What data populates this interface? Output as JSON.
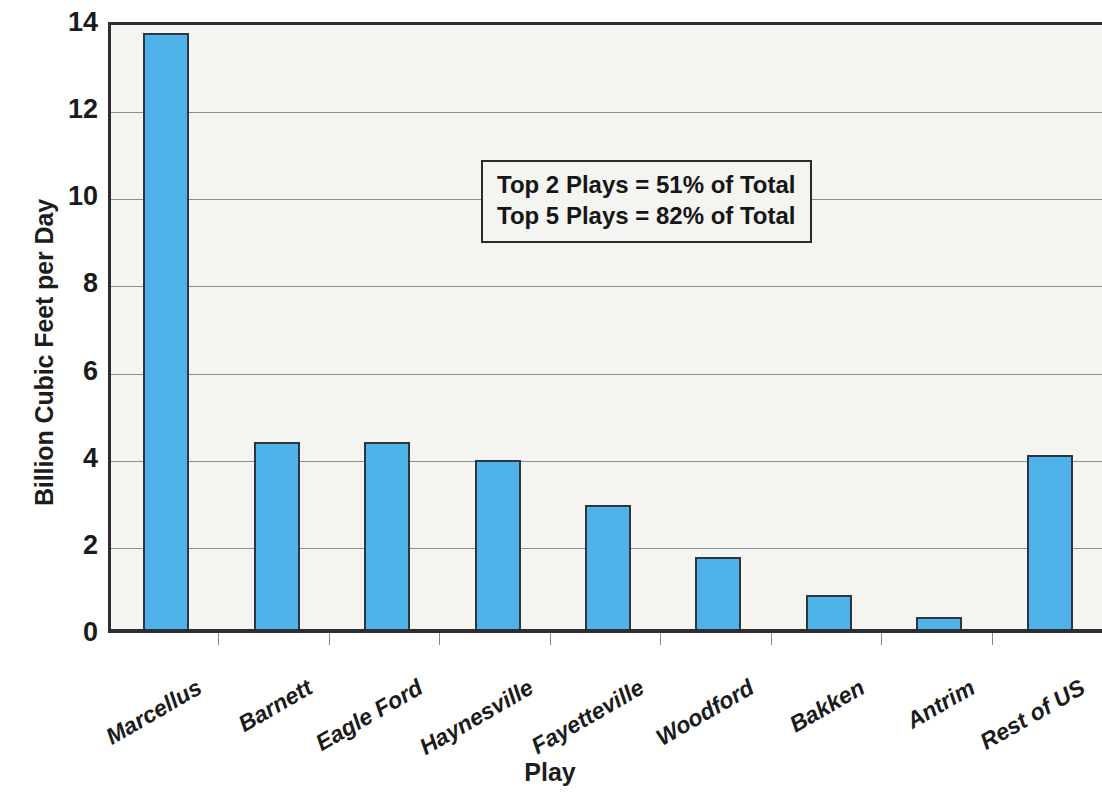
{
  "chart_data": {
    "type": "bar",
    "title": "",
    "xlabel": "Play",
    "ylabel": "Billion Cubic Feet per Day",
    "categories": [
      "Marcellus",
      "Barnett",
      "Eagle Ford",
      "Haynesville",
      "Fayetteville",
      "Woodford",
      "Bakken",
      "Antrim",
      "Rest of US"
    ],
    "values": [
      13.75,
      4.37,
      4.35,
      3.95,
      2.92,
      1.72,
      0.84,
      0.35,
      4.06
    ],
    "ylim": [
      0,
      14
    ],
    "yticks": [
      0,
      2,
      4,
      6,
      8,
      10,
      12,
      14
    ],
    "ytick_labels": [
      "0",
      "2",
      "4",
      "6",
      "8",
      "10",
      "12",
      "14"
    ],
    "grid": true,
    "legend": false,
    "bar_color": "#4fb2e8",
    "bar_edge_color": "#303641",
    "plot_background": "#f4f4f1",
    "gridline_color": "#8e8e8e",
    "annotations": [
      "Top 2 Plays = 51% of Total",
      "Top 5 Plays = 82% of Total"
    ]
  }
}
